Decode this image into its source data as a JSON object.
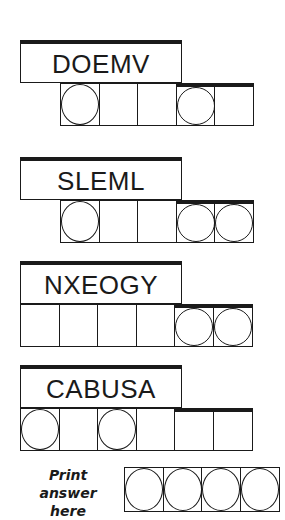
{
  "puzzles": [
    {
      "scrambled": "DOEMV",
      "cells": [
        true,
        false,
        false,
        true,
        false
      ],
      "top": 40,
      "cells_left": 60
    },
    {
      "scrambled": "SLEML",
      "cells": [
        true,
        false,
        false,
        true,
        true
      ],
      "top": 157,
      "cells_left": 60
    },
    {
      "scrambled": "NXEOGY",
      "cells": [
        false,
        false,
        false,
        false,
        true,
        true
      ],
      "top": 261,
      "cells_left": 20
    },
    {
      "scrambled": "CABUSA",
      "cells": [
        true,
        false,
        true,
        false,
        false,
        false
      ],
      "top": 365,
      "cells_left": 20
    }
  ],
  "answer": {
    "label_line1": "Print answer",
    "label_line2": "here",
    "cells": [
      true,
      true,
      true,
      true
    ]
  },
  "colors": {
    "ink": "#1a1a1a",
    "background": "#ffffff"
  }
}
